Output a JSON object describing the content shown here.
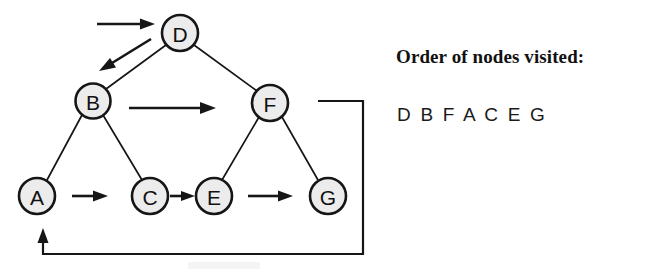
{
  "figure": {
    "type": "binary-tree-traversal-diagram",
    "nodes": [
      {
        "id": "D",
        "label": "D",
        "cx": 180,
        "cy": 33,
        "r": 18
      },
      {
        "id": "B",
        "label": "B",
        "cx": 93,
        "cy": 101,
        "r": 17.5
      },
      {
        "id": "F",
        "label": "F",
        "cx": 270,
        "cy": 103,
        "r": 18
      },
      {
        "id": "A",
        "label": "A",
        "cx": 37,
        "cy": 196,
        "r": 18
      },
      {
        "id": "C",
        "label": "C",
        "cx": 150,
        "cy": 196,
        "r": 18
      },
      {
        "id": "E",
        "label": "E",
        "cx": 214,
        "cy": 196,
        "r": 18
      },
      {
        "id": "G",
        "label": "G",
        "cx": 328,
        "cy": 196,
        "r": 18
      }
    ],
    "tree_edges": [
      {
        "from": "D",
        "to": "B"
      },
      {
        "from": "D",
        "to": "F"
      },
      {
        "from": "B",
        "to": "A"
      },
      {
        "from": "B",
        "to": "C"
      },
      {
        "from": "F",
        "to": "E"
      },
      {
        "from": "F",
        "to": "G"
      }
    ],
    "traversal_arrows": [
      {
        "name": "entry-arrow-to-d",
        "label": "entry into D"
      },
      {
        "name": "arrow-d-to-b",
        "label": "D to B"
      },
      {
        "name": "arrow-b-to-f",
        "label": "B to F"
      },
      {
        "name": "arrow-a-to-c",
        "label": "A to C"
      },
      {
        "name": "arrow-c-to-e",
        "label": "C to E"
      },
      {
        "name": "arrow-e-to-g",
        "label": "E to G"
      },
      {
        "name": "arrow-g-wrap-to-a",
        "label": "G wraps back to A"
      }
    ]
  },
  "caption": {
    "title": "Order of nodes visited:",
    "sequence": "D B F A C E G"
  },
  "colors": {
    "node_fill": "#ececec",
    "stroke": "#161616",
    "text": "#111111",
    "background": "#ffffff"
  }
}
